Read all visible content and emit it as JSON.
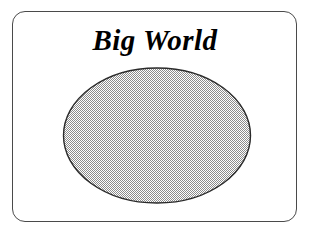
{
  "canvas": {
    "width": 313,
    "height": 235,
    "background_color": "#ffffff"
  },
  "frame": {
    "shape": "rounded-rectangle",
    "border_color": "#4a4a4a",
    "border_width_px": 1,
    "corner_radius_px": 13,
    "fill": "none"
  },
  "title": {
    "text": "Big World",
    "style": "bold italic serif",
    "color": "#000000",
    "align": "center",
    "font_size_px": 29
  },
  "figure": {
    "shape_name": "ellipse",
    "label": "big-world-ellipse",
    "center_x": 156,
    "center_y": 135,
    "radius_x": 93,
    "radius_y": 67,
    "fill_pattern": "50-percent-checkerboard-dither",
    "fill_color": "#808080",
    "fill_background_color": "#ffffff",
    "outline_color": "#2a2a2a",
    "outline_width_px": 1.4
  }
}
